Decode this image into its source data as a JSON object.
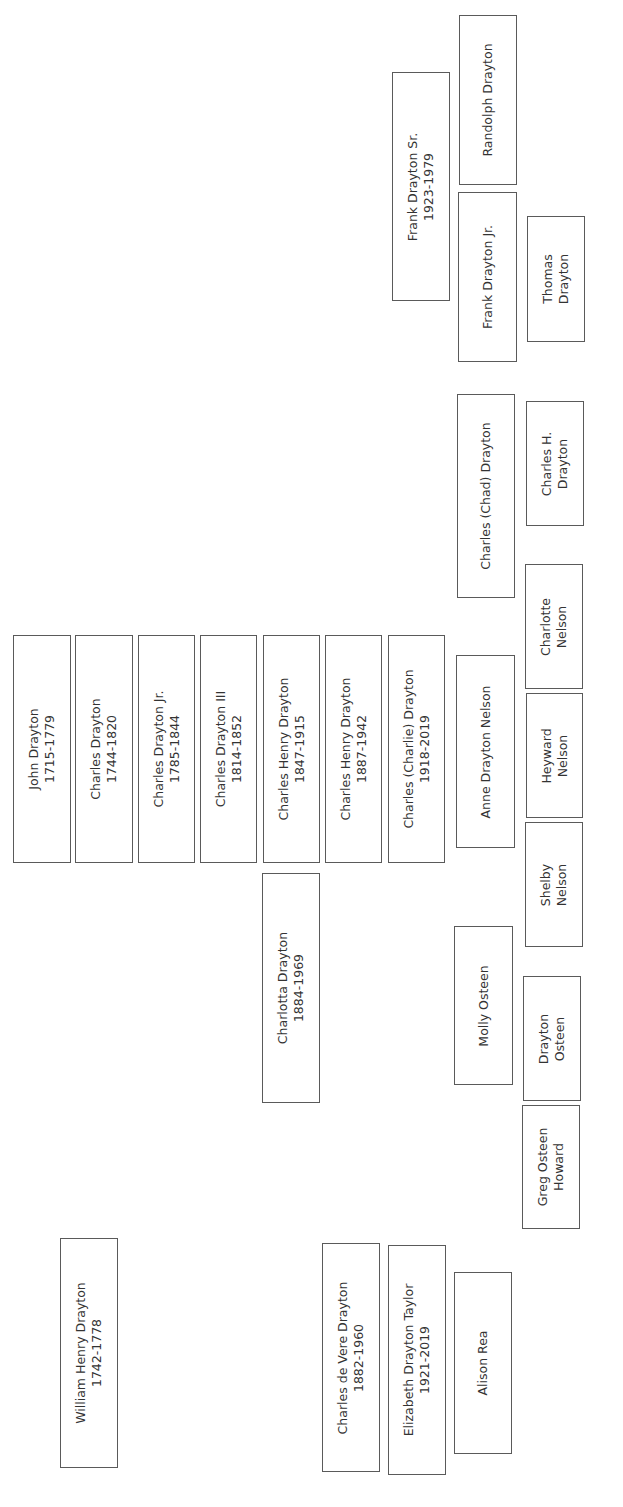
{
  "diagram": {
    "type": "family-tree",
    "orientation": "rotated-90-ccw",
    "border_color": "#5a5a5a",
    "text_color": "#333333",
    "people": [
      {
        "id": "randolph",
        "name": "Randolph Drayton",
        "years": "",
        "x": 459,
        "y": 15,
        "w": 58,
        "h": 170
      },
      {
        "id": "frank-sr",
        "name": "Frank Drayton Sr.",
        "years": "1923-1979",
        "x": 392,
        "y": 72,
        "w": 58,
        "h": 229
      },
      {
        "id": "frank-jr",
        "name": "Frank Drayton Jr.",
        "years": "",
        "x": 458,
        "y": 192,
        "w": 59,
        "h": 170
      },
      {
        "id": "thomas",
        "name": "Thomas",
        "name2": "Drayton",
        "years": "",
        "x": 527,
        "y": 216,
        "w": 58,
        "h": 126
      },
      {
        "id": "chad",
        "name": "Charles (Chad) Drayton",
        "years": "",
        "x": 457,
        "y": 394,
        "w": 58,
        "h": 204
      },
      {
        "id": "charles-h",
        "name": "Charles H.",
        "name2": "Drayton",
        "years": "",
        "x": 526,
        "y": 401,
        "w": 58,
        "h": 125
      },
      {
        "id": "charlotte-nelson",
        "name": "Charlotte",
        "name2": "Nelson",
        "years": "",
        "x": 525,
        "y": 564,
        "w": 58,
        "h": 125
      },
      {
        "id": "john",
        "name": "John Drayton",
        "years": "1715-1779",
        "x": 13,
        "y": 635,
        "w": 58,
        "h": 228
      },
      {
        "id": "charles-1744",
        "name": "Charles Drayton",
        "years": "1744-1820",
        "x": 75,
        "y": 635,
        "w": 58,
        "h": 228
      },
      {
        "id": "charles-jr",
        "name": "Charles Drayton Jr.",
        "years": "1785-1844",
        "x": 138,
        "y": 635,
        "w": 57,
        "h": 228
      },
      {
        "id": "charles-iii",
        "name": "Charles Drayton III",
        "years": "1814-1852",
        "x": 200,
        "y": 635,
        "w": 57,
        "h": 228
      },
      {
        "id": "charles-henry-1847",
        "name": "Charles Henry Drayton",
        "years": "1847-1915",
        "x": 263,
        "y": 635,
        "w": 57,
        "h": 228
      },
      {
        "id": "charles-henry-1887",
        "name": "Charles Henry Drayton",
        "years": "1887-1942",
        "x": 325,
        "y": 635,
        "w": 57,
        "h": 228
      },
      {
        "id": "charlie",
        "name": "Charles (Charlie) Drayton",
        "years": "1918-2019",
        "x": 388,
        "y": 635,
        "w": 57,
        "h": 228
      },
      {
        "id": "anne",
        "name": "Anne Drayton Nelson",
        "years": "",
        "x": 456,
        "y": 655,
        "w": 59,
        "h": 193
      },
      {
        "id": "heyward",
        "name": "Heyward",
        "name2": "Nelson",
        "years": "",
        "x": 526,
        "y": 693,
        "w": 57,
        "h": 125
      },
      {
        "id": "shelby",
        "name": "Shelby",
        "name2": "Nelson",
        "years": "",
        "x": 525,
        "y": 822,
        "w": 58,
        "h": 125
      },
      {
        "id": "charlotta",
        "name": "Charlotta Drayton",
        "years": "1884-1969",
        "x": 262,
        "y": 873,
        "w": 58,
        "h": 230
      },
      {
        "id": "molly",
        "name": "Molly Osteen",
        "years": "",
        "x": 454,
        "y": 926,
        "w": 59,
        "h": 159
      },
      {
        "id": "drayton-osteen",
        "name": "Drayton",
        "name2": "Osteen",
        "years": "",
        "x": 523,
        "y": 976,
        "w": 58,
        "h": 125
      },
      {
        "id": "greg",
        "name": "Greg Osteen",
        "name2": "Howard",
        "years": "",
        "x": 522,
        "y": 1105,
        "w": 58,
        "h": 124
      },
      {
        "id": "william",
        "name": "William Henry Drayton",
        "years": "1742-1778",
        "x": 60,
        "y": 1238,
        "w": 58,
        "h": 230
      },
      {
        "id": "charles-de-vere",
        "name": "Charles de Vere Drayton",
        "years": "1882-1960",
        "x": 322,
        "y": 1243,
        "w": 58,
        "h": 229
      },
      {
        "id": "elizabeth",
        "name": "Elizabeth Drayton Taylor",
        "years": "1921-2019",
        "x": 388,
        "y": 1245,
        "w": 58,
        "h": 230
      },
      {
        "id": "alison",
        "name": "Alison Rea",
        "years": "",
        "x": 454,
        "y": 1272,
        "w": 58,
        "h": 182
      }
    ]
  }
}
